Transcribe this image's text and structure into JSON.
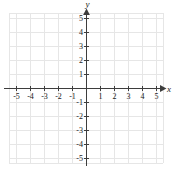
{
  "chart_data": {
    "type": "scatter",
    "title": "",
    "xlabel": "x",
    "ylabel": "y",
    "xlim": [
      -5.5,
      5.5
    ],
    "ylim": [
      -5.5,
      5.5
    ],
    "grid": true,
    "legend": null,
    "series": [],
    "x_tick_labels": [
      "-5",
      "-4",
      "-3",
      "-2",
      "-1",
      "1",
      "2",
      "3",
      "4",
      "5"
    ],
    "x_tick_values": [
      -5,
      -4,
      -3,
      -2,
      -1,
      1,
      2,
      3,
      4,
      5
    ],
    "y_tick_labels": [
      "5",
      "4",
      "3",
      "2",
      "1",
      "-1",
      "-2",
      "-3",
      "-4",
      "-5"
    ],
    "y_tick_values": [
      5,
      4,
      3,
      2,
      1,
      -1,
      -2,
      -3,
      -4,
      -5
    ],
    "annotations": [],
    "colors": {
      "grid": "#e6e6e6",
      "axis": "#3d3d3d",
      "text": "#1a1a1a",
      "background": "#ffffff"
    }
  },
  "axes": {
    "x_name": "x",
    "y_name": "y"
  }
}
